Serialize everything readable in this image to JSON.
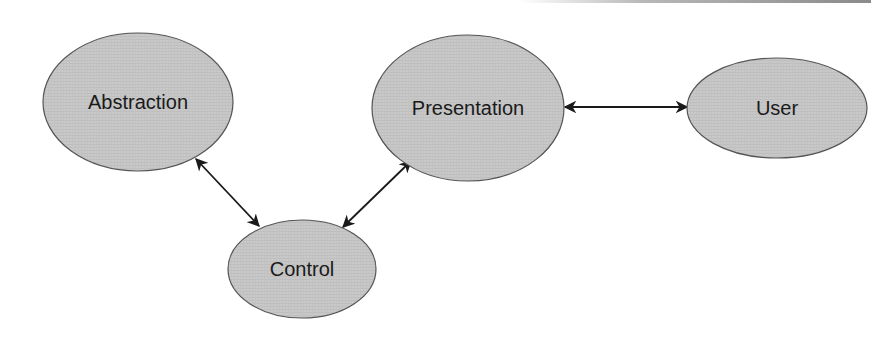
{
  "diagram": {
    "type": "architecture-diagram",
    "fill_color": "#c8c8c8",
    "stroke_color": "#555555",
    "arrow_color": "#1a1a1a",
    "nodes": [
      {
        "id": "abstraction",
        "label": "Abstraction",
        "cx": 138,
        "cy": 102,
        "rx": 95,
        "ry": 69
      },
      {
        "id": "presentation",
        "label": "Presentation",
        "cx": 468,
        "cy": 108,
        "rx": 96,
        "ry": 73
      },
      {
        "id": "user",
        "label": "User",
        "cx": 777,
        "cy": 108,
        "rx": 90,
        "ry": 50
      },
      {
        "id": "control",
        "label": "Control",
        "cx": 302,
        "cy": 269,
        "rx": 74,
        "ry": 49
      }
    ],
    "edges": [
      {
        "from": "abstraction",
        "to": "control",
        "bidirectional": true,
        "x1": 196,
        "y1": 159,
        "x2": 259,
        "y2": 226
      },
      {
        "from": "presentation",
        "to": "control",
        "bidirectional": true,
        "x1": 411,
        "y1": 161,
        "x2": 343,
        "y2": 227
      },
      {
        "from": "presentation",
        "to": "user",
        "bidirectional": true,
        "x1": 565,
        "y1": 107,
        "x2": 687,
        "y2": 107
      }
    ]
  }
}
